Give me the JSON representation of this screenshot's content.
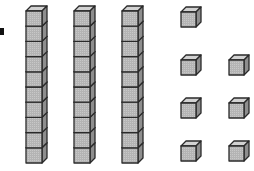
{
  "figure": {
    "colors": {
      "face": "#b4b4b4",
      "top": "#d2d2d2",
      "side": "#8e8e8e",
      "stroke": "#2a2a2a",
      "background": "#ffffff",
      "bullet": "#111111"
    },
    "bullet": {
      "x": 0,
      "y": 28,
      "w": 4,
      "h": 7
    },
    "rod": {
      "cubes_per_rod": 10,
      "face_w": 16,
      "cube_h": 15.2,
      "depth": 5,
      "top_y": 11
    },
    "rods": [
      {
        "x": 26
      },
      {
        "x": 74
      },
      {
        "x": 122
      }
    ],
    "unit": {
      "face_w": 15,
      "face_h": 15,
      "depth": 5
    },
    "units": [
      {
        "x": 181,
        "y": 12
      },
      {
        "x": 181,
        "y": 60
      },
      {
        "x": 229,
        "y": 60
      },
      {
        "x": 181,
        "y": 103
      },
      {
        "x": 229,
        "y": 103
      },
      {
        "x": 181,
        "y": 146
      },
      {
        "x": 229,
        "y": 146
      }
    ],
    "counts": {
      "tens": 3,
      "ones": 7,
      "value": 37
    }
  }
}
